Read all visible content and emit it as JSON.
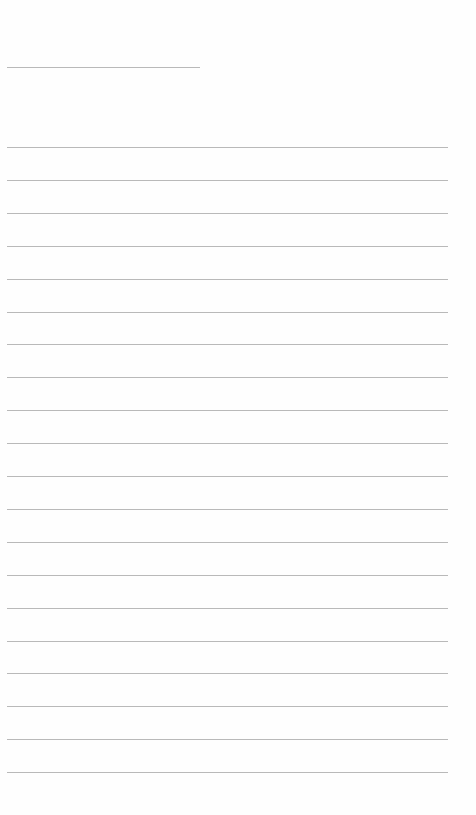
{
  "page": {
    "type": "lined-paper",
    "background_color": "#fefefe",
    "rule_color": "#b9b9b9"
  },
  "header_line": {
    "label": "",
    "value": "",
    "placeholder": "",
    "x": 7,
    "y": 67,
    "width": 193
  },
  "body_lines": {
    "count": 20,
    "x": 7,
    "width": 441,
    "first_y": 147,
    "spacing": 32.9,
    "values": [
      "",
      "",
      "",
      "",
      "",
      "",
      "",
      "",
      "",
      "",
      "",
      "",
      "",
      "",
      "",
      "",
      "",
      "",
      "",
      ""
    ]
  }
}
